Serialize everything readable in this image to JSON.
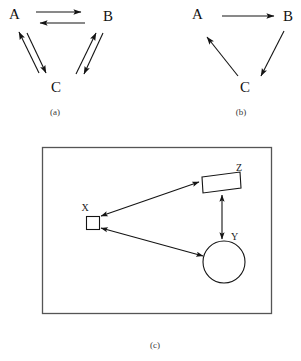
{
  "figure": {
    "panels": [
      {
        "id": "a",
        "caption": "(a)",
        "nodes": [
          {
            "id": "A",
            "label": "A"
          },
          {
            "id": "B",
            "label": "B"
          },
          {
            "id": "C",
            "label": "C"
          }
        ],
        "edges": [
          {
            "from": "A",
            "to": "B",
            "direction": "forward"
          },
          {
            "from": "B",
            "to": "A",
            "direction": "forward"
          },
          {
            "from": "C",
            "to": "A",
            "direction": "forward"
          },
          {
            "from": "A",
            "to": "C",
            "direction": "forward"
          },
          {
            "from": "C",
            "to": "B",
            "direction": "forward"
          },
          {
            "from": "B",
            "to": "C",
            "direction": "forward"
          }
        ]
      },
      {
        "id": "b",
        "caption": "(b)",
        "nodes": [
          {
            "id": "A",
            "label": "A"
          },
          {
            "id": "B",
            "label": "B"
          },
          {
            "id": "C",
            "label": "C"
          }
        ],
        "edges": [
          {
            "from": "A",
            "to": "B",
            "direction": "forward"
          },
          {
            "from": "B",
            "to": "C",
            "direction": "forward"
          },
          {
            "from": "C",
            "to": "A",
            "direction": "forward"
          }
        ]
      },
      {
        "id": "c",
        "caption": "(c)",
        "nodes": [
          {
            "id": "X",
            "label": "X",
            "shape": "square"
          },
          {
            "id": "Y",
            "label": "Y",
            "shape": "circle"
          },
          {
            "id": "Z",
            "label": "Z",
            "shape": "parallelogram"
          }
        ],
        "edges": [
          {
            "from": "X",
            "to": "Z",
            "direction": "both"
          },
          {
            "from": "X",
            "to": "Y",
            "direction": "both"
          },
          {
            "from": "Z",
            "to": "Y",
            "direction": "both"
          }
        ]
      }
    ]
  },
  "colors": {
    "stroke": "#141414",
    "frame": "#555555",
    "background": "#ffffff"
  }
}
